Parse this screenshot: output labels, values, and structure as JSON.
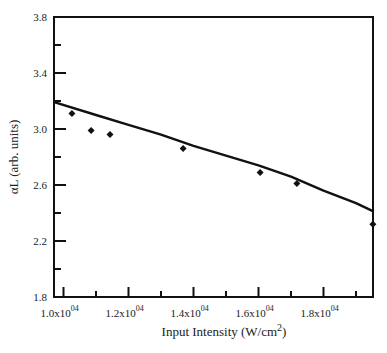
{
  "chart_data": {
    "type": "scatter",
    "title": "",
    "xlabel": "Input Intensity (W/cm2)",
    "xlabel_parts": {
      "main": "Input Intensity (W/cm",
      "sup": "2",
      "close": ")"
    },
    "ylabel": "αL (arb. units)",
    "x_unit_scale": "x10^4",
    "xlim": [
      0.974,
      1.955
    ],
    "ylim": [
      1.8,
      3.8
    ],
    "x_ticks": [
      {
        "value": 1.0,
        "label": "1.0x10",
        "exp": "04"
      },
      {
        "value": 1.2,
        "label": "1.2x10",
        "exp": "04"
      },
      {
        "value": 1.4,
        "label": "1.4x10",
        "exp": "04"
      },
      {
        "value": 1.6,
        "label": "1.6x10",
        "exp": "04"
      },
      {
        "value": 1.8,
        "label": "1.8x10",
        "exp": "04"
      }
    ],
    "x_minor_ticks": [
      1.1,
      1.3,
      1.5,
      1.7,
      1.9
    ],
    "y_ticks": [
      {
        "value": 1.8,
        "label": "1.8"
      },
      {
        "value": 2.2,
        "label": "2.2"
      },
      {
        "value": 2.6,
        "label": "2.6"
      },
      {
        "value": 3.0,
        "label": "3.0"
      },
      {
        "value": 3.4,
        "label": "3.4"
      },
      {
        "value": 3.8,
        "label": "3.8"
      }
    ],
    "y_minor_ticks": [
      2.0,
      2.4,
      2.8,
      3.2,
      3.6
    ],
    "grid": false,
    "legend": null,
    "series": [
      {
        "name": "measured",
        "style": "diamond-markers",
        "x": [
          1.026,
          1.085,
          1.143,
          1.368,
          1.605,
          1.718,
          1.952
        ],
        "y": [
          3.11,
          2.99,
          2.96,
          2.86,
          2.69,
          2.61,
          2.32
        ]
      },
      {
        "name": "fit",
        "style": "solid-line",
        "x": [
          0.974,
          1.1,
          1.2,
          1.3,
          1.4,
          1.5,
          1.6,
          1.7,
          1.8,
          1.9,
          1.955
        ],
        "y": [
          3.19,
          3.1,
          3.03,
          2.96,
          2.88,
          2.81,
          2.74,
          2.66,
          2.56,
          2.47,
          2.41
        ]
      }
    ]
  }
}
